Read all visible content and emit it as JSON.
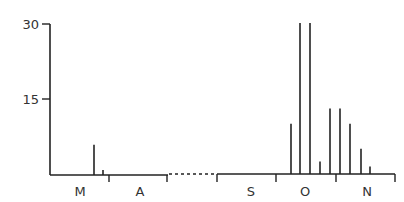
{
  "chart_data": {
    "type": "bar",
    "title": "",
    "xlabel": "",
    "ylabel": "",
    "ylim": [
      0,
      30
    ],
    "yticks": [
      15,
      30
    ],
    "grid": false,
    "legend": null,
    "x_segments": [
      {
        "months": [
          "M",
          "A"
        ],
        "note": "left segment"
      },
      {
        "months": [
          "S",
          "O",
          "N"
        ],
        "note": "right segment, separated by dotted axis break"
      }
    ],
    "x_tick_labels": [
      "M",
      "A",
      "S",
      "O",
      "N"
    ],
    "series": [
      {
        "name": "counts",
        "points": [
          {
            "month": "M",
            "position": "late March",
            "value": 6
          },
          {
            "month": "M",
            "position": "end of March",
            "value": 1
          },
          {
            "month": "O",
            "position": "early October",
            "value": 10
          },
          {
            "month": "O",
            "position": "October",
            "value": 30
          },
          {
            "month": "O",
            "position": "October",
            "value": 30
          },
          {
            "month": "O",
            "position": "late October",
            "value": 2.5
          },
          {
            "month": "O",
            "position": "late October",
            "value": 13
          },
          {
            "month": "N",
            "position": "early November",
            "value": 13
          },
          {
            "month": "N",
            "position": "November",
            "value": 10
          },
          {
            "month": "N",
            "position": "November",
            "value": 5
          },
          {
            "month": "N",
            "position": "November",
            "value": 1.5
          }
        ]
      }
    ]
  },
  "axis": {
    "y_tick_30": "30",
    "y_tick_15": "15",
    "month_M": "M",
    "month_A": "A",
    "month_S": "S",
    "month_O": "O",
    "month_N": "N"
  }
}
